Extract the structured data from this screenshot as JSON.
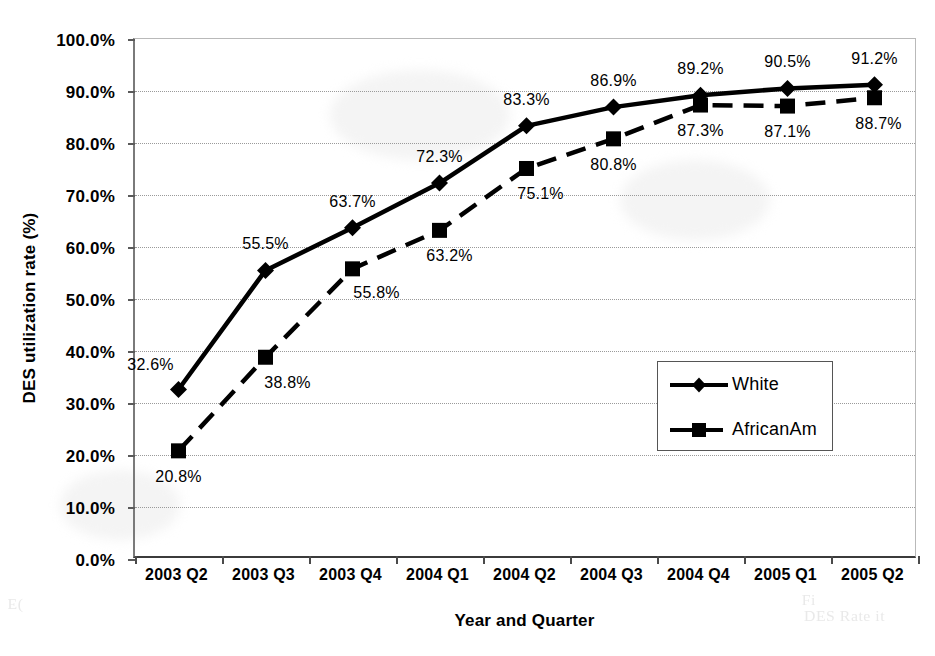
{
  "chart_data": {
    "type": "line",
    "title": "",
    "xlabel": "Year and Quarter",
    "ylabel": "DES utilization rate (%)",
    "categories": [
      "2003 Q2",
      "2003 Q3",
      "2003 Q4",
      "2004 Q1",
      "2004 Q2",
      "2004 Q3",
      "2004 Q4",
      "2005 Q1",
      "2005 Q2"
    ],
    "ylim": [
      0,
      100
    ],
    "ytick_step": 10,
    "ytick_labels": [
      "0.0%",
      "10.0%",
      "20.0%",
      "30.0%",
      "40.0%",
      "50.0%",
      "60.0%",
      "70.0%",
      "80.0%",
      "90.0%",
      "100.0%"
    ],
    "ytick_values": [
      0,
      10,
      20,
      30,
      40,
      50,
      60,
      70,
      80,
      90,
      100
    ],
    "grid": true,
    "legend_position": "inside-right-middle",
    "series": [
      {
        "name": "White",
        "marker": "diamond",
        "line_style": "solid",
        "color": "#000000",
        "values": [
          32.6,
          55.5,
          63.7,
          72.3,
          83.3,
          86.9,
          89.2,
          90.5,
          91.2
        ],
        "value_labels": [
          "32.6%",
          "55.5%",
          "63.7%",
          "72.3%",
          "83.3%",
          "86.9%",
          "89.2%",
          "90.5%",
          "91.2%"
        ],
        "label_offsets": [
          [
            -28,
            -24
          ],
          [
            0,
            -26
          ],
          [
            0,
            -26
          ],
          [
            0,
            -26
          ],
          [
            0,
            -26
          ],
          [
            0,
            -26
          ],
          [
            0,
            -26
          ],
          [
            0,
            -26
          ],
          [
            0,
            -26
          ]
        ]
      },
      {
        "name": "AfricanAm",
        "marker": "square",
        "line_style": "dashed",
        "color": "#000000",
        "values": [
          20.8,
          38.8,
          55.8,
          63.2,
          75.1,
          80.8,
          87.3,
          87.1,
          88.7
        ],
        "value_labels": [
          "20.8%",
          "38.8%",
          "55.8%",
          "63.2%",
          "75.1%",
          "80.8%",
          "87.3%",
          "87.1%",
          "88.7%"
        ],
        "label_offsets": [
          [
            0,
            26
          ],
          [
            22,
            26
          ],
          [
            24,
            24
          ],
          [
            10,
            26
          ],
          [
            14,
            26
          ],
          [
            0,
            26
          ],
          [
            0,
            26
          ],
          [
            0,
            26
          ],
          [
            4,
            26
          ]
        ]
      }
    ]
  },
  "artifacts": {
    "bleed_left": "E(",
    "bleed_right_1": "DES Rate it",
    "bleed_right_2": "Fi"
  }
}
